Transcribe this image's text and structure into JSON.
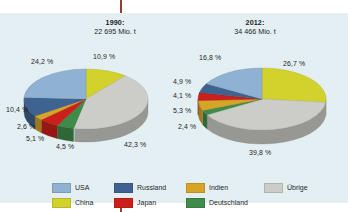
{
  "figure": {
    "background": "#e4eff4",
    "bleed_mark_color": "#9a3c30"
  },
  "left": {
    "year": "1990:",
    "total": "22 695 Mio. t"
  },
  "right": {
    "year": "2012:",
    "total": "34 466 Mio. t"
  },
  "legend": {
    "items": [
      {
        "label": "USA",
        "color": "#8fb2d2"
      },
      {
        "label": "Russland",
        "color": "#3f6390"
      },
      {
        "label": "Indien",
        "color": "#d6a426"
      },
      {
        "label": "Übrige",
        "color": "#cccdc8"
      },
      {
        "label": "China",
        "color": "#d3d22c"
      },
      {
        "label": "Japan",
        "color": "#cc1f1b"
      },
      {
        "label": "Deutschland",
        "color": "#3f8c4a"
      }
    ]
  },
  "chart_data": [
    {
      "type": "pie",
      "title": "1990: 22 695 Mio. t",
      "total_label": "22 695 Mio. t",
      "year": 1990,
      "unit": "Mio. t",
      "total_value": 22695,
      "categories": [
        "China",
        "Übrige",
        "Deutschland",
        "Japan",
        "Indien",
        "Russland",
        "USA"
      ],
      "values": [
        10.9,
        42.3,
        4.5,
        5.1,
        2.6,
        10.4,
        24.2
      ],
      "value_labels": [
        "10,9 %",
        "42,3 %",
        "4,5 %",
        "5,1 %",
        "2,6 %",
        "10,4 %",
        "24,2 %"
      ],
      "colors": [
        "#d3d22c",
        "#cccdc8",
        "#3f8c4a",
        "#cc1f1b",
        "#d6a426",
        "#3f6390",
        "#8fb2d2"
      ],
      "legend_position": "bottom",
      "grid": false
    },
    {
      "type": "pie",
      "title": "2012: 34 466 Mio. t",
      "total_label": "34 466 Mio. t",
      "year": 2012,
      "unit": "Mio. t",
      "total_value": 34466,
      "categories": [
        "China",
        "Übrige",
        "Deutschland",
        "Indien",
        "Japan",
        "Russland",
        "USA"
      ],
      "values": [
        26.7,
        39.8,
        2.4,
        5.3,
        4.1,
        4.9,
        16.8
      ],
      "value_labels": [
        "26,7 %",
        "39,8 %",
        "2,4 %",
        "5,3 %",
        "4,1 %",
        "4,9 %",
        "16,8 %"
      ],
      "colors": [
        "#d3d22c",
        "#cccdc8",
        "#3f8c4a",
        "#d6a426",
        "#cc1f1b",
        "#3f6390",
        "#8fb2d2"
      ],
      "legend_position": "bottom",
      "grid": false
    }
  ],
  "labels_left": {
    "china": "10,9 %",
    "uebrige": "42,3 %",
    "deutschland": "4,5 %",
    "japan": "5,1 %",
    "indien": "2,6 %",
    "russland": "10,4 %",
    "usa": "24,2 %"
  },
  "labels_right": {
    "china": "26,7 %",
    "uebrige": "39,8 %",
    "deutschland": "2,4 %",
    "indien": "5,3 %",
    "japan": "4,1 %",
    "russland": "4,9 %",
    "usa": "16,8 %"
  }
}
